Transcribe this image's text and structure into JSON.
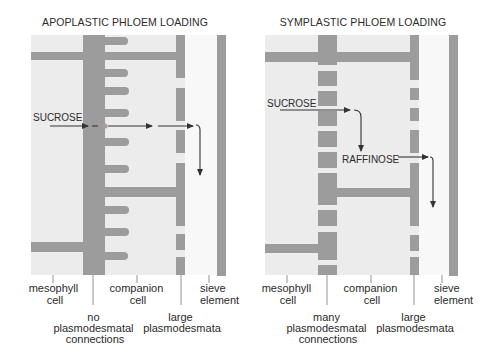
{
  "panels": [
    {
      "title": "APOPLASTIC PHLOEM LOADING",
      "flow_labels": {
        "sucrose": "SUCROSE"
      },
      "labels": {
        "mesophyll": [
          "mesophyll",
          "cell"
        ],
        "connections": [
          "no",
          "plasmodesmatal",
          "connections"
        ],
        "companion": [
          "companion",
          "cell"
        ],
        "large": [
          "large",
          "plasmodesmata"
        ],
        "sieve": [
          "sieve",
          "element"
        ]
      }
    },
    {
      "title": "SYMPLASTIC PHLOEM LOADING",
      "flow_labels": {
        "sucrose": "SUCROSE",
        "raffinose": "RAFFINOSE"
      },
      "labels": {
        "mesophyll": [
          "mesophyll",
          "cell"
        ],
        "connections": [
          "many",
          "plasmodesmatal",
          "connections"
        ],
        "companion": [
          "companion",
          "cell"
        ],
        "large": [
          "large",
          "plasmodesmata"
        ],
        "sieve": [
          "sieve",
          "element"
        ]
      }
    }
  ],
  "colors": {
    "wall": "#9c9c9c",
    "cell": "#ececec",
    "sieve_lumen": "#f8f8f8",
    "text": "#2b2b2b",
    "arrow": "#333333"
  }
}
